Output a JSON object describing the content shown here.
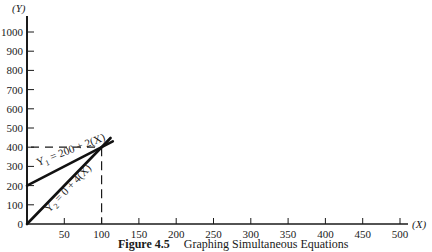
{
  "chart_data": {
    "type": "line",
    "title": "Graphing Simultaneous Equations",
    "figure_number": "Figure 4.5",
    "xlabel": "(X)",
    "ylabel": "(Y)",
    "xlim": [
      0,
      500
    ],
    "ylim": [
      0,
      1000
    ],
    "x_ticks": [
      50,
      100,
      150,
      200,
      250,
      300,
      350,
      400,
      450,
      500
    ],
    "y_ticks": [
      0,
      100,
      200,
      300,
      400,
      500,
      600,
      700,
      800,
      900,
      1000
    ],
    "grid": false,
    "series": [
      {
        "name": "Y1 = 200 + 2(X)",
        "intercept": 200,
        "slope": 2,
        "x": [
          0,
          115
        ],
        "y": [
          200,
          430
        ]
      },
      {
        "name": "Y2 = 0 + 4(X)",
        "intercept": 0,
        "slope": 4,
        "x": [
          0,
          112
        ],
        "y": [
          0,
          448
        ]
      }
    ],
    "annotations": [
      {
        "type": "dashed-guide",
        "point": {
          "x": 100,
          "y": 400
        },
        "label": "intersection"
      }
    ]
  },
  "labels": {
    "y_axis": "(Y)",
    "x_axis": "(X)",
    "eq1": "Y",
    "eq1_sub": "1",
    "eq1_rest": " = 200 + 2(X)",
    "eq2": "Y",
    "eq2_sub": "2",
    "eq2_rest": " = 0 + 4(X)",
    "figure": "Figure 4.5",
    "caption": "Graphing Simultaneous Equations"
  }
}
